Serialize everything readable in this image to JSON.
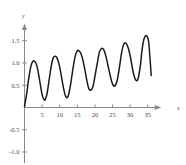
{
  "chart_data": {
    "type": "line",
    "title": "",
    "xlabel": "x",
    "ylabel": "y",
    "xlim": [
      -1.5,
      39
    ],
    "ylim": [
      -1.25,
      1.9
    ],
    "grid": false,
    "legend": null,
    "axis_color": "#8a8a8a",
    "curve_color": "#1a1a1a",
    "xticks": [
      5,
      10,
      15,
      20,
      25,
      30,
      35
    ],
    "xtick_labels": [
      "5",
      "10",
      "15",
      "20",
      "25",
      "30",
      "35"
    ],
    "yticks": [
      1.5,
      1.0,
      0.5,
      -0.5,
      -1.0
    ],
    "ytick_labels": [
      "1.5",
      "1.0",
      "0.5",
      "-0.5",
      "-1.0"
    ],
    "series": [
      {
        "name": "curve",
        "x": [
          0,
          0.6,
          1.2,
          1.8,
          2.4,
          3.0,
          3.4,
          3.8,
          4.4,
          5.0,
          5.6,
          6.0,
          6.4,
          7.0,
          7.6,
          8.2,
          8.8,
          9.2,
          9.8,
          10.4,
          11.0,
          11.6,
          12.1,
          12.6,
          13.2,
          13.8,
          14.4,
          15.0,
          15.4,
          16.0,
          16.6,
          17.2,
          17.8,
          18.3,
          18.9,
          19.5,
          20.1,
          20.8,
          21.3,
          21.9,
          22.5,
          23.1,
          23.7,
          24.4,
          25.0,
          25.6,
          26.3,
          27.0,
          27.6,
          28.2,
          28.8,
          29.5,
          30.2,
          30.8,
          31.5,
          32.2,
          32.9,
          33.4,
          34.0,
          34.7,
          35.3,
          36.0
        ],
        "y": [
          0.02,
          0.3,
          0.65,
          0.92,
          1.04,
          1.03,
          0.96,
          0.84,
          0.56,
          0.29,
          0.17,
          0.2,
          0.31,
          0.62,
          0.93,
          1.12,
          1.15,
          1.12,
          0.98,
          0.74,
          0.47,
          0.27,
          0.22,
          0.31,
          0.57,
          0.89,
          1.15,
          1.27,
          1.28,
          1.22,
          1.06,
          0.83,
          0.57,
          0.42,
          0.39,
          0.49,
          0.74,
          1.05,
          1.25,
          1.33,
          1.3,
          1.16,
          0.95,
          0.7,
          0.53,
          0.48,
          0.6,
          0.92,
          1.24,
          1.42,
          1.45,
          1.33,
          1.09,
          0.82,
          0.63,
          0.63,
          0.93,
          1.3,
          1.55,
          1.61,
          1.45,
          0.72
        ]
      }
    ]
  }
}
